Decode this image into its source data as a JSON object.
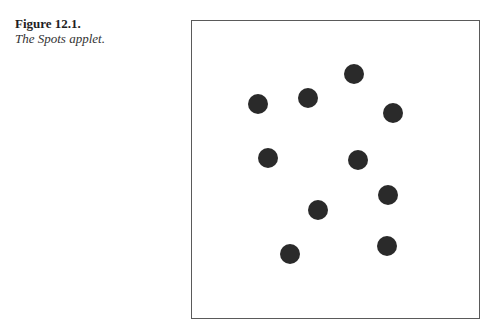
{
  "caption": {
    "label": "Figure 12.1.",
    "title": "The Spots applet."
  },
  "applet": {
    "name": "Spots applet",
    "spot_color": "#2a2a2a",
    "spot_diameter": 20,
    "spots": [
      {
        "x": 258,
        "y": 104
      },
      {
        "x": 308,
        "y": 98
      },
      {
        "x": 354,
        "y": 74
      },
      {
        "x": 393,
        "y": 113
      },
      {
        "x": 268,
        "y": 158
      },
      {
        "x": 358,
        "y": 160
      },
      {
        "x": 388,
        "y": 195
      },
      {
        "x": 318,
        "y": 210
      },
      {
        "x": 290,
        "y": 254
      },
      {
        "x": 387,
        "y": 246
      }
    ]
  }
}
